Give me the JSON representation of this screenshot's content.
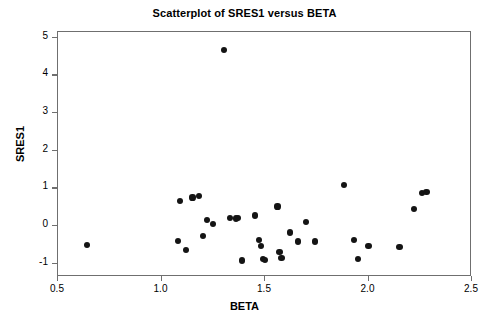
{
  "chart_data": {
    "type": "scatter",
    "title": "Scatterplot of SRES1 versus BETA",
    "xlabel": "BETA",
    "ylabel": "SRES1",
    "xlim": [
      0.5,
      2.5
    ],
    "ylim": [
      -1.35,
      5.15
    ],
    "xticks": [
      0.5,
      1.0,
      1.5,
      2.0,
      2.5
    ],
    "xticklabels": [
      "0.5",
      "1.0",
      "1.5",
      "2.0",
      "2.5"
    ],
    "yticks": [
      -1,
      0,
      1,
      2,
      3,
      4,
      5
    ],
    "yticklabels": [
      "-1",
      "0",
      "1",
      "2",
      "3",
      "4",
      "5"
    ],
    "grid": false,
    "legend": false,
    "marker": "filled-circle",
    "marker_color": "#141414",
    "frame_color": "#6f6f6f",
    "points": [
      {
        "x": 0.64,
        "y": -0.5
      },
      {
        "x": 1.09,
        "y": 0.67
      },
      {
        "x": 1.08,
        "y": -0.39
      },
      {
        "x": 1.12,
        "y": -0.63
      },
      {
        "x": 1.15,
        "y": 0.76
      },
      {
        "x": 1.18,
        "y": 0.79
      },
      {
        "x": 1.2,
        "y": -0.26
      },
      {
        "x": 1.22,
        "y": 0.16
      },
      {
        "x": 1.25,
        "y": 0.06
      },
      {
        "x": 1.3,
        "y": 4.67
      },
      {
        "x": 1.33,
        "y": 0.21
      },
      {
        "x": 1.36,
        "y": 0.2
      },
      {
        "x": 1.37,
        "y": 0.21
      },
      {
        "x": 1.39,
        "y": -0.91
      },
      {
        "x": 1.45,
        "y": 0.28
      },
      {
        "x": 1.47,
        "y": -0.37
      },
      {
        "x": 1.48,
        "y": -0.53
      },
      {
        "x": 1.49,
        "y": -0.87
      },
      {
        "x": 1.5,
        "y": -0.9
      },
      {
        "x": 1.56,
        "y": 0.52
      },
      {
        "x": 1.57,
        "y": -0.68
      },
      {
        "x": 1.58,
        "y": -0.84
      },
      {
        "x": 1.62,
        "y": -0.17
      },
      {
        "x": 1.66,
        "y": -0.41
      },
      {
        "x": 1.7,
        "y": 0.1
      },
      {
        "x": 1.74,
        "y": -0.41
      },
      {
        "x": 1.88,
        "y": 1.1
      },
      {
        "x": 1.93,
        "y": -0.36
      },
      {
        "x": 1.95,
        "y": -0.88
      },
      {
        "x": 2.0,
        "y": -0.53
      },
      {
        "x": 2.15,
        "y": -0.55
      },
      {
        "x": 2.22,
        "y": 0.46
      },
      {
        "x": 2.26,
        "y": 0.88
      },
      {
        "x": 2.28,
        "y": 0.9
      }
    ]
  }
}
